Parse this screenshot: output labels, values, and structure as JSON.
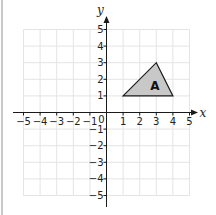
{
  "chart_data": {
    "type": "scatter",
    "title": "",
    "xlabel": "x",
    "ylabel": "y",
    "xlim": [
      -5,
      5
    ],
    "ylim": [
      -5,
      5
    ],
    "grid": true,
    "x_ticks": [
      -5,
      -4,
      -3,
      -2,
      -1,
      0,
      1,
      2,
      3,
      4,
      5
    ],
    "y_ticks": [
      -5,
      -4,
      -3,
      -2,
      -1,
      1,
      2,
      3,
      4,
      5
    ],
    "x_tick_labels": [
      "−5",
      "−4",
      "−3",
      "−2",
      "−1",
      "0",
      "1",
      "2",
      "3",
      "4",
      "5"
    ],
    "y_tick_labels": [
      "−5",
      "−4",
      "−3",
      "−2",
      "−1",
      "1",
      "2",
      "3",
      "4",
      "5"
    ],
    "shapes": [
      {
        "name": "A",
        "type": "triangle",
        "vertices": [
          [
            1,
            1
          ],
          [
            3,
            3
          ],
          [
            4,
            1
          ]
        ],
        "fill": "#c8c8c8",
        "stroke": "#1a1a1a"
      }
    ]
  },
  "colors": {
    "grid": "#e4e4e4",
    "axis": "#1a1a1a",
    "shape_fill": "#c8c8c8"
  }
}
